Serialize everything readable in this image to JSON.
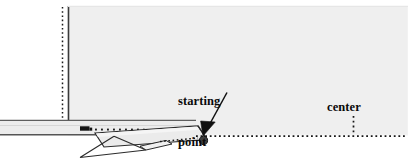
{
  "figure": {
    "kind": "physics-ramp-diagram",
    "background_color": "#ffffff",
    "panel_fill_color": "#efefef",
    "panel_edge_color": "#8c8c8c",
    "ink_color": "#111111",
    "dot_color": "#4a4a4a",
    "labels": {
      "starting_point_line1": "starting",
      "starting_point_line2": "point",
      "center": "center"
    },
    "annotations": {
      "arrow_label": "starting-point-arrow",
      "marker_label": "starting-point-marker"
    },
    "geometry": {
      "panel": {
        "x": 68,
        "y": 6,
        "width": 340,
        "height": 128
      },
      "vertical_dotted_left_x": 62,
      "vertical_solid_left_x": 68,
      "vertical_dotted_center_x": 353,
      "horizontal_dotted_y": 135,
      "horizontal_dotted_x_start": 196,
      "horizontal_dotted_x_end": 404,
      "beam": {
        "x": 0,
        "y": 120,
        "width": 190,
        "height": 15
      },
      "cart": {
        "x": 80,
        "y": 126,
        "width": 10,
        "height": 5
      },
      "cart_trail_dots": 9,
      "ramp_tip": {
        "x": 203,
        "y": 143
      },
      "ramp_top_left": {
        "x": 95,
        "y": 134
      }
    }
  }
}
